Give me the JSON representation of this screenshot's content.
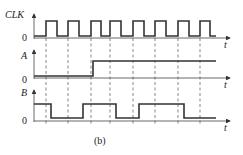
{
  "figure": {
    "caption": "(b)",
    "time_label": "t",
    "zero_label": "0"
  },
  "signals": [
    {
      "name": "CLK",
      "type": "clock",
      "periods": 8
    },
    {
      "name": "A",
      "type": "step",
      "initial": 0,
      "transition_after_edge": 3,
      "final": 1
    },
    {
      "name": "B",
      "type": "toggle",
      "levels": [
        "1 → 0 at edge 1",
        "0 → 1 at edge 3 (mid)",
        "1 → 0 at edge 5 (mid)",
        "0 → 1 at edge 6 (mid)",
        "1 → 0 at edge 8 (mid)"
      ]
    }
  ],
  "colors": {
    "waveform": "#333333",
    "background": "#ffffff"
  },
  "labels": {
    "clk": "CLK",
    "a": "A",
    "b": "B",
    "t1": "t",
    "t2": "t",
    "t3": "t",
    "z1": "0",
    "z2": "0",
    "z3": "0",
    "caption": "(b)"
  }
}
